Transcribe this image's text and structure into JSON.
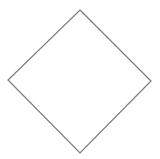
{
  "diagram": {
    "shapes": [
      {
        "type": "diamond",
        "points": [
          [
            80,
            10
          ],
          [
            151,
            81
          ],
          [
            80,
            153
          ],
          [
            8,
            80
          ]
        ],
        "stroke": "#7a7a7a",
        "fill": "#ffffff",
        "stroke_width": 1.2
      }
    ]
  }
}
